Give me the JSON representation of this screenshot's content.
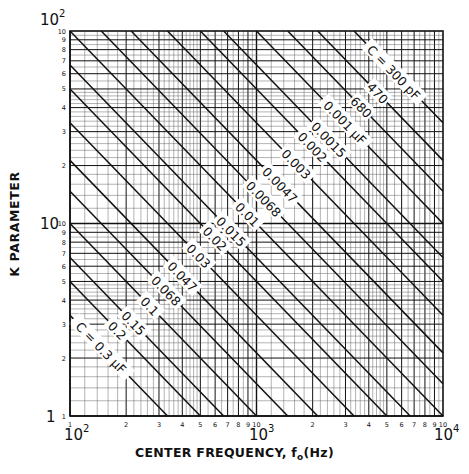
{
  "chart_data": {
    "type": "line",
    "title": "",
    "xlabel": "CENTER FREQUENCY, f_o(Hz)",
    "xlabel_main": "CENTER FREQUENCY, f",
    "xlabel_sub": "o",
    "xlabel_tail": "(Hz)",
    "ylabel": "K PARAMETER",
    "xscale": "log",
    "yscale": "log",
    "xlim": [
      100,
      10000
    ],
    "ylim": [
      1,
      100
    ],
    "grid": true,
    "x_decade_labels": [
      {
        "base": "10",
        "exp": "2"
      },
      {
        "base": "10",
        "exp": "3"
      },
      {
        "base": "10",
        "exp": "4"
      }
    ],
    "y_decade_labels": [
      {
        "text": "1"
      },
      {
        "text": "10"
      },
      {
        "base": "10",
        "exp": "2"
      }
    ],
    "x_minor_tick_labels": [
      "1",
      "2",
      "3",
      "4",
      "5",
      "6",
      "7",
      "8",
      "9",
      "10"
    ],
    "y_minor_tick_labels": [
      "1",
      "2",
      "3",
      "4",
      "5",
      "6",
      "7",
      "8",
      "9",
      "10"
    ],
    "relation": "K = 1e-4 / (f_o * C)",
    "series": [
      {
        "name": "C = 300 pF",
        "label": "C = 300 pF",
        "C_farads": 3e-10
      },
      {
        "name": "470",
        "label": "470",
        "C_farads": 4.7e-10
      },
      {
        "name": "680",
        "label": "680",
        "C_farads": 6.8e-10
      },
      {
        "name": "0.001 µF",
        "label": "0.001 µF",
        "C_farads": 1e-09
      },
      {
        "name": "0.0015",
        "label": "0.0015",
        "C_farads": 1.5e-09
      },
      {
        "name": "0.002",
        "label": "0.002",
        "C_farads": 2e-09
      },
      {
        "name": "0.003",
        "label": "0.003",
        "C_farads": 3e-09
      },
      {
        "name": "0.0047",
        "label": "0.0047",
        "C_farads": 4.7e-09
      },
      {
        "name": "0.0068",
        "label": "0.0068",
        "C_farads": 6.8e-09
      },
      {
        "name": "0.01",
        "label": "0.01",
        "C_farads": 1e-08
      },
      {
        "name": "0.015",
        "label": "0.015",
        "C_farads": 1.5e-08
      },
      {
        "name": "0.02",
        "label": "0.02",
        "C_farads": 2e-08
      },
      {
        "name": "0.03",
        "label": "0.03",
        "C_farads": 3e-08
      },
      {
        "name": "0.047",
        "label": "0.047",
        "C_farads": 4.7e-08
      },
      {
        "name": "0.068",
        "label": "0.068",
        "C_farads": 6.8e-08
      },
      {
        "name": "0.1",
        "label": "0.1",
        "C_farads": 1e-07
      },
      {
        "name": "0.15",
        "label": "0.15",
        "C_farads": 1.5e-07
      },
      {
        "name": "0.2",
        "label": "0.2",
        "C_farads": 2e-07
      },
      {
        "name": "C = 0.3 µF",
        "label": "C = 0.3 µF",
        "C_farads": 3e-07
      }
    ],
    "sample_points": [
      {
        "C": "300 pF",
        "f_at_K100": 3333,
        "K_at_f10000": 33.3
      },
      {
        "C": "0.3 µF",
        "K_at_f100": 3.33,
        "f_at_K1": 333
      }
    ],
    "legend": "inline labels along lines, upper-right to lower-left"
  },
  "colors": {
    "background": "#ffffff",
    "ink": "#111111",
    "grid_minor": "#444444"
  }
}
